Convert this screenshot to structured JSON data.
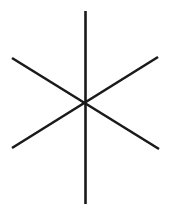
{
  "canvas": {
    "width": 170,
    "height": 216,
    "background_color": "#ffffff"
  },
  "figure": {
    "name": "six-pointed-asterisk",
    "stroke_color": "#1a1a1a",
    "stroke_width": 2.6,
    "center": {
      "x": 85.5,
      "y": 103.5
    },
    "spoke_count": 6,
    "line_count": 3
  },
  "chart_data": {
    "type": "line",
    "title": "",
    "xlabel": "",
    "ylabel": "",
    "xlim": [
      0,
      170
    ],
    "ylim": [
      0,
      216
    ],
    "grid": false,
    "legend": "none",
    "series": [
      {
        "name": "vertical-line",
        "x": [
          85.5,
          85.5
        ],
        "y": [
          11,
          204
        ]
      },
      {
        "name": "diagonal-line-up-right",
        "x": [
          12,
          158
        ],
        "y": [
          148,
          57
        ]
      },
      {
        "name": "diagonal-line-down-right",
        "x": [
          12,
          159
        ],
        "y": [
          58,
          149
        ]
      }
    ]
  }
}
